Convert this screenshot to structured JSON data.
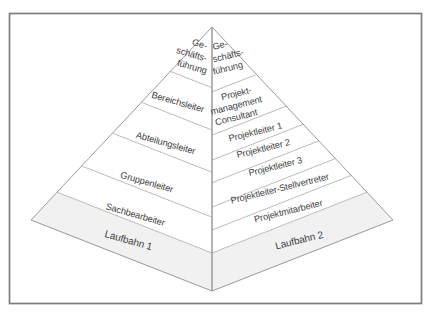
{
  "colors": {
    "background": "#ffffff",
    "frame": "#7d7d7d",
    "pyramid_outline": "#9a9a9a",
    "divider_lines": "#b4b4b4",
    "text": "#3e3e3e",
    "base_band_shade": "#f1f1f1"
  },
  "pyramid": {
    "left": {
      "top_lines": [
        "Ge-",
        "schäfts-",
        "führung"
      ],
      "levels": [
        "Bereichsleiter",
        "Abteilungsleiter",
        "Gruppenleiter",
        "Sachbearbeiter"
      ],
      "base_label": "Laufbahn 1"
    },
    "right": {
      "top_lines": [
        "Ge-",
        "schäfts-",
        "führung"
      ],
      "consultant_lines": [
        "Projekt-",
        "management",
        "Consultant"
      ],
      "levels": [
        "Projektleiter 1",
        "Projektleiter 2",
        "Projektleiter 3",
        "Projektleiter-Stellvertreter",
        "Projektmitarbeiter"
      ],
      "base_label": "Laufbahn 2"
    }
  }
}
